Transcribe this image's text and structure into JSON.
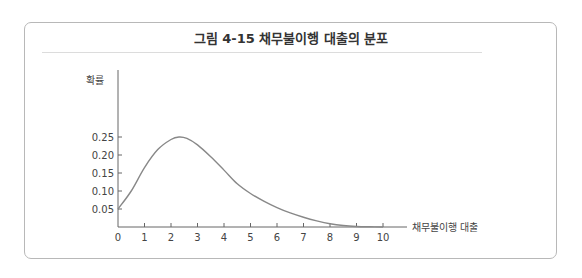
{
  "figure": {
    "title": "그림 4-15   채무불이행 대출의 분포"
  },
  "chart_data": {
    "type": "line",
    "title": "채무불이행 대출의 분포",
    "figure_number": "그림 4-15",
    "xlabel": "채무불이행 대출",
    "ylabel": "확률",
    "x_ticks": [
      0,
      1,
      2,
      3,
      4,
      5,
      6,
      7,
      8,
      9,
      10
    ],
    "y_ticks": [
      0.05,
      0.1,
      0.15,
      0.2,
      0.25
    ],
    "y_tick_labels": [
      "0.05",
      "0.10",
      "0.15",
      "0.20",
      "0.25"
    ],
    "xlim": [
      0,
      10.8
    ],
    "ylim": [
      0,
      0.36
    ],
    "grid": false,
    "legend": null,
    "series": [
      {
        "name": "확률",
        "x": [
          0,
          0.5,
          1,
          1.5,
          2,
          2.3,
          2.6,
          3,
          3.5,
          4,
          4.5,
          5,
          5.5,
          6,
          6.5,
          7,
          7.5,
          8,
          8.5,
          9,
          9.5,
          10
        ],
        "y": [
          0.05,
          0.1,
          0.165,
          0.215,
          0.243,
          0.25,
          0.246,
          0.228,
          0.195,
          0.158,
          0.12,
          0.093,
          0.072,
          0.054,
          0.039,
          0.027,
          0.017,
          0.009,
          0.004,
          0.0015,
          0.0005,
          0.0
        ]
      }
    ]
  }
}
